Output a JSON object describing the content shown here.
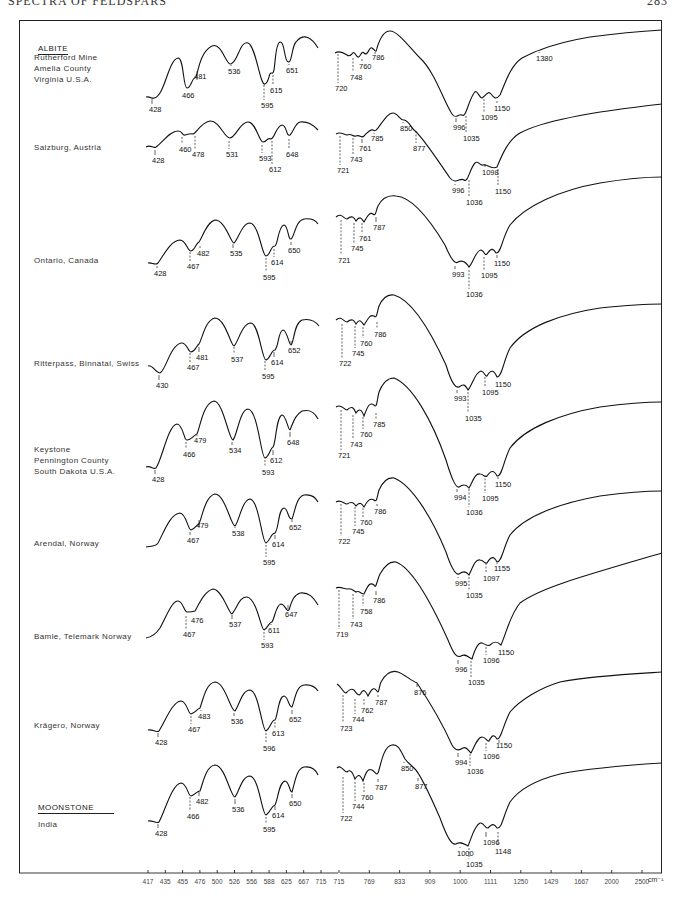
{
  "page": {
    "running_head": "SPECTRA OF FELDSPARS",
    "page_number": "283"
  },
  "groups": {
    "albite": "ALBITE",
    "moonstone": "MOONSTONE"
  },
  "x_axis": {
    "left_panel_ticks": [
      "417",
      "435",
      "455",
      "476",
      "500",
      "526",
      "556",
      "588",
      "625",
      "667",
      "715"
    ],
    "right_panel_ticks": [
      "715",
      "769",
      "833",
      "909",
      "1000",
      "1111",
      "1250",
      "1429",
      "1667",
      "2000",
      "2500"
    ],
    "unit": "cm⁻¹"
  },
  "chart_data": {
    "type": "line",
    "xlabel": "Wavenumber (cm⁻¹)",
    "ylabel": "Transmittance (relative, offset)",
    "x_scale": "wavelength-linear (reciprocal wavenumber ticks)",
    "x_ticks": [
      417,
      435,
      455,
      476,
      500,
      526,
      556,
      588,
      625,
      667,
      715,
      769,
      833,
      909,
      1000,
      1111,
      1250,
      1429,
      1667,
      2000,
      2500
    ],
    "grid": false,
    "legend": "none (samples labelled at left)",
    "series": [
      {
        "name": "Rutherford Mine, Amelia County, Virginia U.S.A.",
        "group": "ALBITE",
        "absorption_bands": [
          428,
          466,
          481,
          536,
          595,
          615,
          651,
          720,
          748,
          760,
          786,
          996,
          1035,
          1095,
          1150,
          1380
        ]
      },
      {
        "name": "Salzburg, Austria",
        "group": "ALBITE",
        "absorption_bands": [
          428,
          460,
          478,
          531,
          593,
          612,
          648,
          721,
          743,
          761,
          785,
          850,
          877,
          996,
          1036,
          1098,
          1150
        ]
      },
      {
        "name": "Ontario, Canada",
        "group": "ALBITE",
        "absorption_bands": [
          428,
          467,
          482,
          535,
          595,
          614,
          650,
          721,
          745,
          761,
          787,
          993,
          1036,
          1095,
          1150
        ]
      },
      {
        "name": "Ritterpass, Binnatal, Swiss",
        "group": "ALBITE",
        "absorption_bands": [
          430,
          467,
          481,
          537,
          595,
          614,
          652,
          722,
          745,
          760,
          786,
          993,
          1035,
          1095,
          1150
        ]
      },
      {
        "name": "Keystone, Pennington County, South Dakota U.S.A.",
        "group": "ALBITE",
        "absorption_bands": [
          428,
          466,
          479,
          534,
          593,
          612,
          648,
          721,
          743,
          760,
          785,
          994,
          1036,
          1095,
          1150
        ]
      },
      {
        "name": "Arendal, Norway",
        "group": "ALBITE",
        "absorption_bands": [
          467,
          479,
          538,
          595,
          614,
          652,
          722,
          745,
          760,
          786,
          995,
          1035,
          1097,
          1155
        ]
      },
      {
        "name": "Bamle, Telemark Norway",
        "group": "ALBITE",
        "absorption_bands": [
          467,
          476,
          537,
          593,
          611,
          647,
          719,
          743,
          758,
          786,
          996,
          1035,
          1096,
          1150
        ]
      },
      {
        "name": "Krägero, Norway",
        "group": "ALBITE",
        "absorption_bands": [
          428,
          467,
          483,
          536,
          596,
          613,
          652,
          723,
          744,
          762,
          787,
          876,
          994,
          1036,
          1096,
          1150
        ]
      },
      {
        "name": "India",
        "group": "MOONSTONE",
        "absorption_bands": [
          428,
          466,
          482,
          536,
          595,
          614,
          650,
          722,
          744,
          760,
          787,
          850,
          877,
          1000,
          1035,
          1096,
          1148
        ]
      }
    ]
  },
  "samples": [
    {
      "label": "Rutherford Mine\nAmelia County\nVirginia U.S.A.",
      "top": 68,
      "left_peaks": [
        {
          "v": "466",
          "x": 185,
          "y": 88,
          "ly": 97
        },
        {
          "v": "481",
          "x": 197,
          "y": 78,
          "ly": 78
        },
        {
          "v": "536",
          "x": 231,
          "y": 63,
          "ly": 73
        },
        {
          "v": "595",
          "x": 264,
          "y": 83,
          "ly": 107
        },
        {
          "v": "615",
          "x": 273,
          "y": 73,
          "ly": 92
        },
        {
          "v": "651",
          "x": 289,
          "y": 62,
          "ly": 72
        },
        {
          "v": "428",
          "x": 152,
          "y": 97,
          "ly": 111
        }
      ],
      "right_peaks": [
        {
          "v": "720",
          "x": 338,
          "y": 52,
          "ly": 90
        },
        {
          "v": "748",
          "x": 353,
          "y": 56,
          "ly": 79
        },
        {
          "v": "760",
          "x": 362,
          "y": 57,
          "ly": 68
        },
        {
          "v": "786",
          "x": 375,
          "y": 52,
          "ly": 59
        },
        {
          "v": "996",
          "x": 456,
          "y": 116,
          "ly": 129
        },
        {
          "v": "1035",
          "x": 466,
          "y": 114,
          "ly": 140
        },
        {
          "v": "1095",
          "x": 484,
          "y": 97,
          "ly": 119
        },
        {
          "v": "1150",
          "x": 497,
          "y": 99,
          "ly": 110
        },
        {
          "v": "1380",
          "x": 539,
          "y": 50,
          "ly": 60
        }
      ]
    },
    {
      "label": "Salzburg, Austria",
      "top": 147,
      "left_peaks": [
        {
          "v": "428",
          "x": 155,
          "y": 148,
          "ly": 162
        },
        {
          "v": "460",
          "x": 182,
          "y": 135,
          "ly": 151
        },
        {
          "v": "478",
          "x": 195,
          "y": 134,
          "ly": 156
        },
        {
          "v": "531",
          "x": 229,
          "y": 139,
          "ly": 156
        },
        {
          "v": "593",
          "x": 262,
          "y": 143,
          "ly": 160
        },
        {
          "v": "612",
          "x": 272,
          "y": 139,
          "ly": 171
        },
        {
          "v": "648",
          "x": 289,
          "y": 137,
          "ly": 156
        }
      ],
      "right_peaks": [
        {
          "v": "721",
          "x": 340,
          "y": 134,
          "ly": 172
        },
        {
          "v": "743",
          "x": 353,
          "y": 136,
          "ly": 161
        },
        {
          "v": "761",
          "x": 362,
          "y": 137,
          "ly": 150
        },
        {
          "v": "785",
          "x": 374,
          "y": 132,
          "ly": 140
        },
        {
          "v": "850",
          "x": 403,
          "y": 120,
          "ly": 130
        },
        {
          "v": "877",
          "x": 416,
          "y": 129,
          "ly": 150
        },
        {
          "v": "996",
          "x": 455,
          "y": 182,
          "ly": 192
        },
        {
          "v": "1036",
          "x": 469,
          "y": 178,
          "ly": 204
        },
        {
          "v": "1098",
          "x": 485,
          "y": 162,
          "ly": 174
        },
        {
          "v": "1150",
          "x": 498,
          "y": 167,
          "ly": 193
        }
      ]
    },
    {
      "label": "Ontario, Canada",
      "top": 260,
      "left_peaks": [
        {
          "v": "428",
          "x": 157,
          "y": 264,
          "ly": 275
        },
        {
          "v": "467",
          "x": 190,
          "y": 250,
          "ly": 268
        },
        {
          "v": "482",
          "x": 200,
          "y": 244,
          "ly": 255
        },
        {
          "v": "535",
          "x": 233,
          "y": 242,
          "ly": 255
        },
        {
          "v": "595",
          "x": 266,
          "y": 256,
          "ly": 279
        },
        {
          "v": "614",
          "x": 274,
          "y": 247,
          "ly": 264
        },
        {
          "v": "650",
          "x": 291,
          "y": 240,
          "ly": 252
        }
      ],
      "right_peaks": [
        {
          "v": "721",
          "x": 341,
          "y": 218,
          "ly": 262
        },
        {
          "v": "745",
          "x": 354,
          "y": 221,
          "ly": 250
        },
        {
          "v": "761",
          "x": 362,
          "y": 221,
          "ly": 240
        },
        {
          "v": "787",
          "x": 376,
          "y": 215,
          "ly": 229
        },
        {
          "v": "993",
          "x": 455,
          "y": 264,
          "ly": 276
        },
        {
          "v": "1036",
          "x": 469,
          "y": 268,
          "ly": 296
        },
        {
          "v": "1095",
          "x": 484,
          "y": 255,
          "ly": 277
        },
        {
          "v": "1150",
          "x": 497,
          "y": 253,
          "ly": 265
        }
      ]
    },
    {
      "label": "Ritterpass, Binnatal, Swiss",
      "top": 363,
      "left_peaks": [
        {
          "v": "430",
          "x": 159,
          "y": 373,
          "ly": 387
        },
        {
          "v": "467",
          "x": 190,
          "y": 351,
          "ly": 369
        },
        {
          "v": "481",
          "x": 199,
          "y": 345,
          "ly": 359
        },
        {
          "v": "537",
          "x": 234,
          "y": 345,
          "ly": 361
        },
        {
          "v": "595",
          "x": 265,
          "y": 359,
          "ly": 378
        },
        {
          "v": "614",
          "x": 274,
          "y": 350,
          "ly": 364
        },
        {
          "v": "652",
          "x": 291,
          "y": 339,
          "ly": 352
        }
      ],
      "right_peaks": [
        {
          "v": "722",
          "x": 342,
          "y": 322,
          "ly": 365
        },
        {
          "v": "745",
          "x": 355,
          "y": 324,
          "ly": 355
        },
        {
          "v": "760",
          "x": 363,
          "y": 325,
          "ly": 345
        },
        {
          "v": "786",
          "x": 377,
          "y": 320,
          "ly": 336
        },
        {
          "v": "993",
          "x": 457,
          "y": 388,
          "ly": 400
        },
        {
          "v": "1035",
          "x": 468,
          "y": 390,
          "ly": 420
        },
        {
          "v": "1095",
          "x": 485,
          "y": 375,
          "ly": 394
        },
        {
          "v": "1150",
          "x": 498,
          "y": 377,
          "ly": 386
        }
      ]
    },
    {
      "label": "Keystone\nPennington County\nSouth Dakota U.S.A.",
      "top": 460,
      "left_peaks": [
        {
          "v": "466",
          "x": 186,
          "y": 440,
          "ly": 456
        },
        {
          "v": "479",
          "x": 197,
          "y": 434,
          "ly": 442
        },
        {
          "v": "534",
          "x": 232,
          "y": 440,
          "ly": 452
        },
        {
          "v": "593",
          "x": 265,
          "y": 458,
          "ly": 474
        },
        {
          "v": "612",
          "x": 273,
          "y": 448,
          "ly": 462
        },
        {
          "v": "648",
          "x": 290,
          "y": 430,
          "ly": 444
        },
        {
          "v": "428",
          "x": 155,
          "y": 468,
          "ly": 481
        }
      ],
      "right_peaks": [
        {
          "v": "721",
          "x": 341,
          "y": 408,
          "ly": 457
        },
        {
          "v": "743",
          "x": 353,
          "y": 413,
          "ly": 446
        },
        {
          "v": "760",
          "x": 363,
          "y": 415,
          "ly": 436
        },
        {
          "v": "785",
          "x": 376,
          "y": 411,
          "ly": 426
        },
        {
          "v": "994",
          "x": 457,
          "y": 487,
          "ly": 499
        },
        {
          "v": "1036",
          "x": 469,
          "y": 487,
          "ly": 514
        },
        {
          "v": "1095",
          "x": 485,
          "y": 473,
          "ly": 500
        },
        {
          "v": "1150",
          "x": 498,
          "y": 475,
          "ly": 486
        }
      ]
    },
    {
      "label": "Arendal, Norway",
      "top": 543,
      "left_peaks": [
        {
          "v": "467",
          "x": 190,
          "y": 530,
          "ly": 542
        },
        {
          "v": "479",
          "x": 199,
          "y": 525,
          "ly": 527
        },
        {
          "v": "538",
          "x": 235,
          "y": 525,
          "ly": 535
        },
        {
          "v": "595",
          "x": 266,
          "y": 543,
          "ly": 564
        },
        {
          "v": "614",
          "x": 275,
          "y": 533,
          "ly": 546
        },
        {
          "v": "652",
          "x": 292,
          "y": 518,
          "ly": 529
        }
      ],
      "right_peaks": [
        {
          "v": "722",
          "x": 341,
          "y": 502,
          "ly": 543
        },
        {
          "v": "745",
          "x": 355,
          "y": 505,
          "ly": 533
        },
        {
          "v": "760",
          "x": 363,
          "y": 506,
          "ly": 524
        },
        {
          "v": "786",
          "x": 377,
          "y": 502,
          "ly": 513
        },
        {
          "v": "995",
          "x": 458,
          "y": 575,
          "ly": 585
        },
        {
          "v": "1035",
          "x": 469,
          "y": 575,
          "ly": 597
        },
        {
          "v": "1097",
          "x": 486,
          "y": 561,
          "ly": 580
        },
        {
          "v": "1155",
          "x": 497,
          "y": 562,
          "ly": 570
        }
      ]
    },
    {
      "label": "Bamle, Telemark Norway",
      "top": 636,
      "left_peaks": [
        {
          "v": "467",
          "x": 186,
          "y": 614,
          "ly": 636
        },
        {
          "v": "476",
          "x": 194,
          "y": 613,
          "ly": 622
        },
        {
          "v": "537",
          "x": 232,
          "y": 613,
          "ly": 626
        },
        {
          "v": "593",
          "x": 264,
          "y": 630,
          "ly": 647
        },
        {
          "v": "611",
          "x": 271,
          "y": 622,
          "ly": 632
        },
        {
          "v": "647",
          "x": 288,
          "y": 603,
          "ly": 616
        }
      ],
      "right_peaks": [
        {
          "v": "719",
          "x": 339,
          "y": 588,
          "ly": 636
        },
        {
          "v": "743",
          "x": 353,
          "y": 592,
          "ly": 626
        },
        {
          "v": "758",
          "x": 363,
          "y": 593,
          "ly": 613
        },
        {
          "v": "786",
          "x": 376,
          "y": 589,
          "ly": 602
        },
        {
          "v": "996",
          "x": 458,
          "y": 658,
          "ly": 671
        },
        {
          "v": "1035",
          "x": 471,
          "y": 659,
          "ly": 684
        },
        {
          "v": "1096",
          "x": 486,
          "y": 645,
          "ly": 662
        },
        {
          "v": "1150",
          "x": 501,
          "y": 645,
          "ly": 654
        }
      ]
    },
    {
      "label": "Krägero, Norway",
      "top": 725,
      "left_peaks": [
        {
          "v": "428",
          "x": 158,
          "y": 731,
          "ly": 744
        },
        {
          "v": "467",
          "x": 191,
          "y": 714,
          "ly": 731
        },
        {
          "v": "483",
          "x": 201,
          "y": 708,
          "ly": 718
        },
        {
          "v": "536",
          "x": 234,
          "y": 711,
          "ly": 723
        },
        {
          "v": "596",
          "x": 266,
          "y": 731,
          "ly": 750
        },
        {
          "v": "613",
          "x": 275,
          "y": 720,
          "ly": 735
        },
        {
          "v": "652",
          "x": 292,
          "y": 708,
          "ly": 721
        }
      ],
      "right_peaks": [
        {
          "v": "723",
          "x": 343,
          "y": 693,
          "ly": 730
        },
        {
          "v": "744",
          "x": 355,
          "y": 697,
          "ly": 721
        },
        {
          "v": "762",
          "x": 364,
          "y": 697,
          "ly": 712
        },
        {
          "v": "787",
          "x": 378,
          "y": 693,
          "ly": 704
        },
        {
          "v": "876",
          "x": 417,
          "y": 682,
          "ly": 694
        },
        {
          "v": "994",
          "x": 458,
          "y": 751,
          "ly": 764
        },
        {
          "v": "1036",
          "x": 470,
          "y": 752,
          "ly": 773
        },
        {
          "v": "1096",
          "x": 486,
          "y": 741,
          "ly": 758
        },
        {
          "v": "1150",
          "x": 499,
          "y": 741,
          "ly": 747
        }
      ]
    },
    {
      "label": "India",
      "top": 823,
      "left_peaks": [
        {
          "v": "428",
          "x": 158,
          "y": 822,
          "ly": 835
        },
        {
          "v": "466",
          "x": 190,
          "y": 795,
          "ly": 818
        },
        {
          "v": "482",
          "x": 199,
          "y": 790,
          "ly": 803
        },
        {
          "v": "536",
          "x": 235,
          "y": 797,
          "ly": 811
        },
        {
          "v": "595",
          "x": 266,
          "y": 815,
          "ly": 831
        },
        {
          "v": "614",
          "x": 275,
          "y": 804,
          "ly": 817
        },
        {
          "v": "650",
          "x": 292,
          "y": 792,
          "ly": 805
        }
      ],
      "right_peaks": [
        {
          "v": "722",
          "x": 343,
          "y": 775,
          "ly": 820
        },
        {
          "v": "744",
          "x": 355,
          "y": 780,
          "ly": 808
        },
        {
          "v": "760",
          "x": 364,
          "y": 781,
          "ly": 799
        },
        {
          "v": "787",
          "x": 378,
          "y": 777,
          "ly": 789
        },
        {
          "v": "850",
          "x": 404,
          "y": 760,
          "ly": 770
        },
        {
          "v": "877",
          "x": 418,
          "y": 776,
          "ly": 788
        },
        {
          "v": "1000",
          "x": 460,
          "y": 845,
          "ly": 855
        },
        {
          "v": "1035",
          "x": 469,
          "y": 846,
          "ly": 866
        },
        {
          "v": "1096",
          "x": 486,
          "y": 830,
          "ly": 844
        },
        {
          "v": "1148",
          "x": 498,
          "y": 830,
          "ly": 853
        }
      ]
    }
  ]
}
